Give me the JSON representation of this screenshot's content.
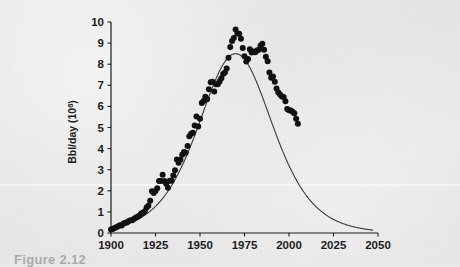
{
  "figure": {
    "caption_partial": "Figure  2.12",
    "background_color": "#e9e9e9",
    "ink_color": "#1c1c1c"
  },
  "chart_data": {
    "type": "scatter",
    "title": "",
    "subtitle": "",
    "xlabel": "",
    "ylabel": "Bbl/day (10",
    "ylabel_sup": "6",
    "ylabel_tail": ")",
    "xlim": [
      1900,
      2050
    ],
    "ylim": [
      0,
      10
    ],
    "xticks": [
      1900,
      1925,
      1950,
      1975,
      2000,
      2025,
      2050
    ],
    "xtick_labels": [
      "1900",
      "1925",
      "1950",
      "1975",
      "2000",
      "2025",
      "2050"
    ],
    "yticks": [
      0,
      1,
      2,
      3,
      4,
      5,
      6,
      7,
      8,
      9,
      10
    ],
    "ytick_labels": [
      "0",
      "1",
      "2",
      "3",
      "4",
      "5",
      "6",
      "7",
      "8",
      "9",
      "10"
    ],
    "grid": false,
    "legend": null,
    "legend_position": "none",
    "series": [
      {
        "name": "Observed production",
        "type": "scatter",
        "marker": "filled-circle",
        "marker_size": 3.0,
        "color": "#111111",
        "x": [
          1900,
          1901,
          1902,
          1903,
          1904,
          1905,
          1906,
          1907,
          1908,
          1909,
          1910,
          1911,
          1912,
          1913,
          1914,
          1915,
          1916,
          1917,
          1918,
          1919,
          1920,
          1921,
          1922,
          1923,
          1924,
          1925,
          1926,
          1927,
          1928,
          1929,
          1930,
          1931,
          1932,
          1933,
          1934,
          1935,
          1936,
          1937,
          1938,
          1939,
          1940,
          1941,
          1942,
          1943,
          1944,
          1945,
          1946,
          1947,
          1948,
          1949,
          1950,
          1951,
          1952,
          1953,
          1954,
          1955,
          1956,
          1957,
          1958,
          1959,
          1960,
          1961,
          1962,
          1963,
          1964,
          1965,
          1966,
          1967,
          1968,
          1969,
          1970,
          1971,
          1972,
          1973,
          1974,
          1975,
          1976,
          1977,
          1978,
          1979,
          1980,
          1981,
          1982,
          1983,
          1984,
          1985,
          1986,
          1987,
          1988,
          1989,
          1990,
          1991,
          1992,
          1993,
          1994,
          1995,
          1996,
          1997,
          1998,
          1999,
          2000,
          2001,
          2002,
          2003,
          2004,
          2005
        ],
        "y": [
          0.17,
          0.19,
          0.24,
          0.27,
          0.32,
          0.37,
          0.35,
          0.45,
          0.48,
          0.5,
          0.57,
          0.61,
          0.61,
          0.68,
          0.73,
          0.77,
          0.83,
          0.93,
          0.96,
          1.03,
          1.21,
          1.29,
          1.53,
          1.98,
          1.9,
          1.99,
          2.12,
          2.46,
          2.46,
          2.76,
          2.46,
          2.33,
          2.15,
          2.48,
          2.48,
          2.73,
          2.97,
          3.48,
          3.33,
          3.47,
          3.71,
          3.84,
          3.8,
          4.12,
          4.58,
          4.7,
          4.75,
          5.09,
          5.52,
          5.05,
          5.41,
          6.16,
          6.26,
          6.46,
          6.34,
          6.81,
          7.15,
          7.17,
          6.71,
          7.05,
          7.05,
          7.18,
          7.33,
          7.54,
          7.61,
          7.8,
          8.3,
          8.81,
          9.1,
          9.24,
          9.64,
          9.46,
          9.44,
          9.21,
          8.77,
          8.38,
          8.13,
          8.25,
          8.71,
          8.55,
          8.6,
          8.57,
          8.65,
          8.69,
          8.88,
          8.97,
          8.68,
          8.35,
          8.14,
          7.61,
          7.36,
          7.42,
          7.17,
          6.85,
          6.66,
          6.56,
          6.47,
          6.45,
          6.25,
          5.88,
          5.82,
          5.8,
          5.75,
          5.68,
          5.42,
          5.18
        ]
      },
      {
        "name": "Hubbert logistic fit",
        "type": "line",
        "color": "#3a3a3a",
        "linewidth": 1.1,
        "peak_year": 1970,
        "peak_value": 8.5,
        "width_years": 28,
        "x_start": 1900,
        "x_end": 2047,
        "value_at_1900": 0.17,
        "value_at_2047": 0.23
      }
    ]
  }
}
